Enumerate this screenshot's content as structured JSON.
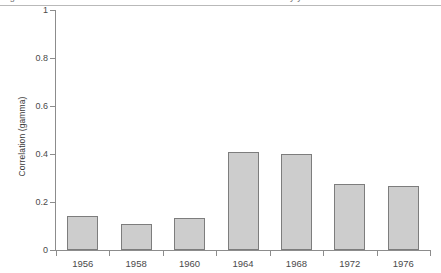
{
  "caption": {
    "text": "Figure 3. Correlation between candidate evaluations and vote choice by year",
    "visible_fragment": "partially cropped line of text at top edge"
  },
  "chart_data": {
    "type": "bar",
    "title": "",
    "xlabel": "",
    "ylabel": "Correlation (gamma)",
    "categories": [
      "1956",
      "1958",
      "1960",
      "1964",
      "1968",
      "1972",
      "1976"
    ],
    "values": [
      0.14,
      0.11,
      0.135,
      0.41,
      0.4,
      0.275,
      0.265
    ],
    "ylim": [
      0,
      1
    ],
    "yticks": [
      "0",
      "0.2",
      "0.4",
      "0.6",
      "0.8",
      "1"
    ],
    "ytick_values": [
      0,
      0.2,
      0.4,
      0.6,
      0.8,
      1
    ],
    "grid": false,
    "legend": null,
    "bar_fill_color": "#cdcdcd",
    "bar_edge_color": "#7d7d7d",
    "axis_color": "#8c8c8c",
    "background_color": "#ffffff"
  }
}
